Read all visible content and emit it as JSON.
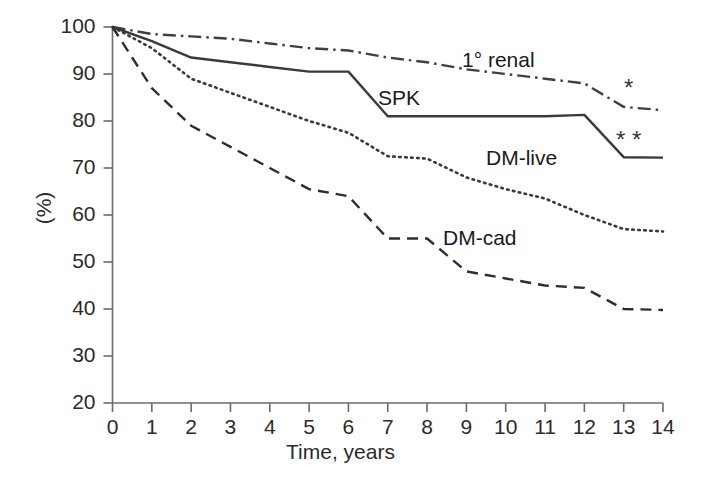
{
  "chart_data": {
    "type": "line",
    "title": "",
    "xlabel": "Time, years",
    "ylabel": "(%)",
    "xlim": [
      0,
      14
    ],
    "ylim": [
      20,
      100
    ],
    "grid": false,
    "legend_position": "inline-annotations",
    "x_ticks": [
      "0",
      "1",
      "2",
      "3",
      "4",
      "5",
      "6",
      "7",
      "8",
      "9",
      "10",
      "11",
      "12",
      "13",
      "14"
    ],
    "y_ticks": [
      "20",
      "30",
      "40",
      "50",
      "60",
      "70",
      "80",
      "90",
      "100"
    ],
    "x": [
      0,
      1,
      2,
      3,
      4,
      5,
      6,
      7,
      8,
      9,
      10,
      11,
      12,
      13,
      14
    ],
    "series": [
      {
        "name": "1° renal",
        "style": "dash-dot",
        "color": "#404040",
        "values": [
          100,
          98.5,
          98,
          97.5,
          96.5,
          95.5,
          95,
          93.5,
          92.5,
          91,
          90,
          89,
          88,
          83,
          82.3
        ],
        "label": "1° renal",
        "label_x": 462,
        "label_y": 48,
        "annotation": "*"
      },
      {
        "name": "SPK",
        "style": "solid",
        "color": "#3a3a3a",
        "values": [
          100,
          97,
          93.5,
          92.5,
          91.5,
          90.5,
          90.5,
          81,
          81,
          81,
          81,
          81,
          81.3,
          72.3,
          72.2
        ],
        "label": "SPK",
        "label_x": 378,
        "label_y": 86,
        "annotation": "* *"
      },
      {
        "name": "DM-live",
        "style": "dotted",
        "color": "#3a3a3a",
        "values": [
          100,
          95.5,
          89,
          86,
          83,
          80,
          77.5,
          72.5,
          72,
          68,
          65.5,
          63.5,
          60,
          57,
          56.5
        ],
        "label": "DM-live",
        "label_x": 486,
        "label_y": 146,
        "annotation": ""
      },
      {
        "name": "DM-cad",
        "style": "dashed",
        "color": "#2e2e2e",
        "values": [
          100,
          87,
          79,
          74.5,
          70,
          65.5,
          64,
          55,
          55,
          48,
          46.5,
          45,
          44.5,
          40,
          39.8
        ],
        "label": "DM-cad",
        "label_x": 443,
        "label_y": 226,
        "annotation": ""
      }
    ],
    "annotations": [
      {
        "text": "*",
        "x": 624,
        "y": 76,
        "name": "asterisk-renal"
      },
      {
        "text": "*  *",
        "x": 616,
        "y": 128,
        "name": "asterisk-spk"
      }
    ]
  },
  "axes": {
    "y_title": "(%)",
    "x_title": "Time, years",
    "y_tick_labels": [
      "100",
      "90",
      "80",
      "70",
      "60",
      "50",
      "40",
      "30",
      "20"
    ],
    "x_tick_labels": [
      "0",
      "1",
      "2",
      "3",
      "4",
      "5",
      "6",
      "7",
      "8",
      "9",
      "10",
      "11",
      "12",
      "13",
      "14"
    ]
  },
  "colors": {
    "background": "#ffffff",
    "axis": "#6b6b6b",
    "text": "#1a1a1a"
  }
}
